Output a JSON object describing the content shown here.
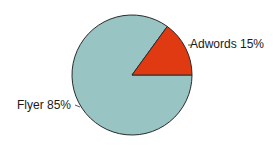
{
  "chart_data": {
    "type": "pie",
    "title": "",
    "slices": [
      {
        "label": "Adwords",
        "value": 15,
        "display": "Adwords 15%",
        "color": "#e03a12"
      },
      {
        "label": "Flyer",
        "value": 85,
        "display": "Flyer 85%",
        "color": "#98c4c4"
      }
    ],
    "legend": "none",
    "labels_position": "outside"
  },
  "labels": {
    "adwords": "Adwords 15%",
    "flyer": "Flyer 85%"
  }
}
